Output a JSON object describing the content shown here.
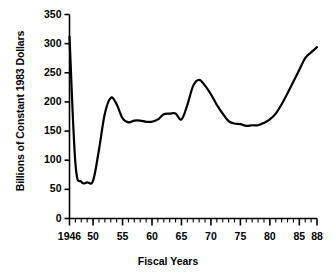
{
  "chart_data": {
    "type": "line",
    "title": "",
    "xlabel": "Fiscal Years",
    "ylabel": "Billions of Constant 1983 Dollars",
    "xlim": [
      1946,
      1988
    ],
    "ylim": [
      0,
      350
    ],
    "yticks": [
      0,
      50,
      100,
      150,
      200,
      250,
      300,
      350
    ],
    "ytick_labels": [
      "0",
      "50",
      "100",
      "150",
      "200",
      "250",
      "300",
      "350"
    ],
    "xtick_labels": [
      "1946",
      "50",
      "55",
      "60",
      "65",
      "70",
      "75",
      "80",
      "85",
      "88"
    ],
    "xtick_values": [
      1946,
      1950,
      1955,
      1960,
      1965,
      1970,
      1975,
      1980,
      1985,
      1988
    ],
    "minor_xticks_interval": 1,
    "grid": false,
    "legend": null,
    "line_color": "#000000",
    "line_width": 2.2,
    "x": [
      1946,
      1947,
      1948,
      1949,
      1950,
      1951,
      1952,
      1953,
      1954,
      1955,
      1956,
      1957,
      1958,
      1959,
      1960,
      1961,
      1962,
      1963,
      1964,
      1965,
      1966,
      1967,
      1968,
      1969,
      1970,
      1971,
      1972,
      1973,
      1974,
      1975,
      1976,
      1977,
      1978,
      1979,
      1980,
      1981,
      1982,
      1983,
      1984,
      1985,
      1986,
      1987,
      1988
    ],
    "values": [
      312,
      95,
      63,
      62,
      65,
      118,
      180,
      207,
      196,
      172,
      165,
      168,
      168,
      166,
      166,
      170,
      179,
      180,
      180,
      170,
      195,
      228,
      238,
      228,
      213,
      195,
      180,
      167,
      163,
      162,
      159,
      160,
      160,
      164,
      170,
      180,
      196,
      215,
      235,
      255,
      275,
      285,
      294
    ],
    "series_name": "National defense outlays"
  }
}
